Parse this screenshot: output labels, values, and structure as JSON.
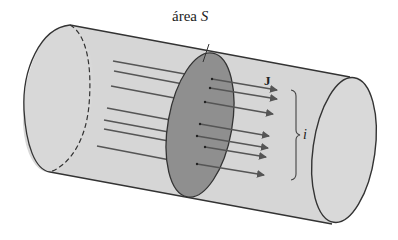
{
  "figure": {
    "labels": {
      "area_word": "área",
      "area_symbol": "S",
      "current_density": "J",
      "current": "i"
    },
    "colors": {
      "cylinder_fill": "#d6d6d6",
      "cylinder_stroke": "#333333",
      "section_fill": "#8f8f8f",
      "arrow": "#555555",
      "background": "#ffffff"
    },
    "arrows_count": 7
  }
}
